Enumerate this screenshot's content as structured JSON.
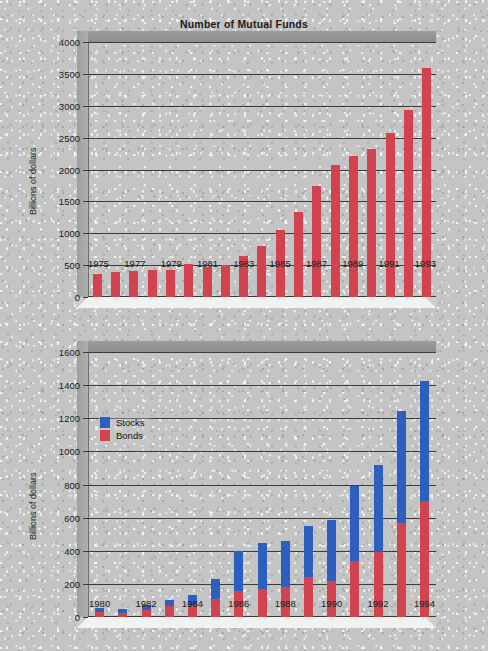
{
  "chart_data": [
    {
      "type": "bar",
      "title": "Number of Mutual Funds",
      "xlabel": "",
      "ylabel": "Billions of dollars",
      "ylim": [
        0,
        4000
      ],
      "ytick_step": 500,
      "yticks": [
        "0",
        "500",
        "1000",
        "1500",
        "2000",
        "2500",
        "3000",
        "3500",
        "4000"
      ],
      "grid": true,
      "legend": "none",
      "bar_color": "#d1434f",
      "categories": [
        "1975",
        "1976",
        "1977",
        "1978",
        "1979",
        "1980",
        "1981",
        "1982",
        "1983",
        "1984",
        "1985",
        "1986",
        "1987",
        "1988",
        "1989",
        "1990",
        "1991",
        "1992",
        "1993"
      ],
      "tick_labels": [
        "1975",
        "",
        "1977",
        "",
        "1979",
        "",
        "1981",
        "",
        "1983",
        "",
        "1985",
        "",
        "1987",
        "",
        "1989",
        "",
        "1991",
        "",
        "1993"
      ],
      "values": [
        360,
        390,
        410,
        430,
        430,
        520,
        470,
        500,
        640,
        800,
        1050,
        1330,
        1740,
        2070,
        2210,
        2320,
        2570,
        2940,
        3590
      ]
    },
    {
      "type": "bar",
      "subtype": "stacked",
      "title": "Composition of Mutual Fund Assets",
      "xlabel": "",
      "ylabel": "Billions of dollars",
      "ylim": [
        0,
        1600
      ],
      "ytick_step": 200,
      "yticks": [
        "0",
        "200",
        "400",
        "600",
        "800",
        "1000",
        "1200",
        "1400",
        "1600"
      ],
      "grid": true,
      "legend_position": "inside-upper-left",
      "categories": [
        "1980",
        "1981",
        "1982",
        "1983",
        "1984",
        "1985",
        "1986",
        "1987",
        "1988",
        "1989",
        "1990",
        "1991",
        "1992",
        "1993",
        "1994"
      ],
      "tick_labels": [
        "1980",
        "",
        "1982",
        "",
        "1984",
        "",
        "1986",
        "",
        "1988",
        "",
        "1990",
        "",
        "1992",
        "",
        "1994"
      ],
      "series": [
        {
          "name": "Bonds",
          "color": "#d1434f",
          "values": [
            30,
            25,
            40,
            65,
            75,
            110,
            155,
            170,
            180,
            240,
            220,
            340,
            395,
            565,
            700
          ]
        },
        {
          "name": "Stocks",
          "color": "#2d5fbe",
          "values": [
            25,
            25,
            30,
            40,
            60,
            120,
            245,
            275,
            280,
            310,
            365,
            450,
            525,
            680,
            725
          ]
        }
      ],
      "totals": [
        55,
        50,
        70,
        105,
        135,
        230,
        400,
        445,
        460,
        550,
        585,
        790,
        920,
        1245,
        1425
      ]
    }
  ],
  "legend": {
    "stocks_label": "Stocks",
    "bonds_label": "Bonds",
    "stocks_color": "#2d5fbe",
    "bonds_color": "#d1434f"
  }
}
